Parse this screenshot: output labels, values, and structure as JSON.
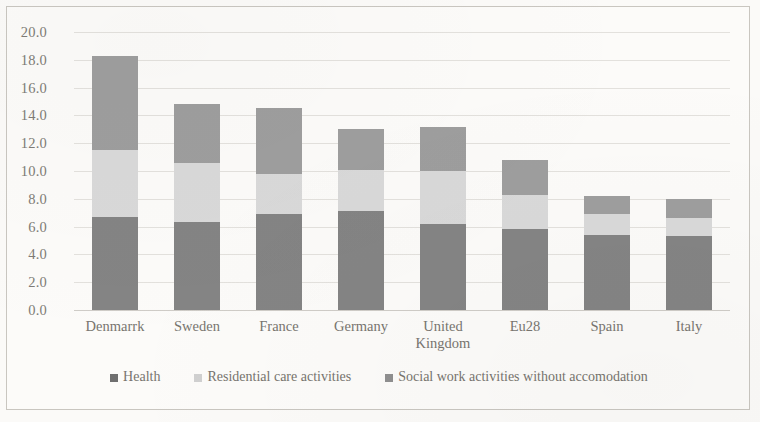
{
  "chart_data": {
    "type": "bar",
    "subtype": "stacked-bar",
    "title": "",
    "xlabel": "",
    "ylabel": "",
    "ylim": [
      0.0,
      20.0
    ],
    "ytick_step": 2.0,
    "ytick_labels": [
      "20.0",
      "18.0",
      "16.0",
      "14.0",
      "12.0",
      "10.0",
      "8.0",
      "6.0",
      "4.0",
      "2.0",
      "0.0"
    ],
    "ytick_values": [
      20.0,
      18.0,
      16.0,
      14.0,
      12.0,
      10.0,
      8.0,
      6.0,
      4.0,
      2.0,
      0.0
    ],
    "grid": true,
    "legend_position": "bottom",
    "categories": [
      "Denmarrk",
      "Sweden",
      "France",
      "Germany",
      "United Kingdom",
      "Eu28",
      "Spain",
      "Italy"
    ],
    "category_labels": [
      [
        "Denmarrk"
      ],
      [
        "Sweden"
      ],
      [
        "France"
      ],
      [
        "Germany"
      ],
      [
        "United",
        "Kingdom"
      ],
      [
        "Eu28"
      ],
      [
        "Spain"
      ],
      [
        "Italy"
      ]
    ],
    "series": [
      {
        "name": "Health",
        "color": "#848484",
        "values": [
          6.7,
          6.3,
          6.9,
          7.1,
          6.2,
          5.8,
          5.4,
          5.3
        ]
      },
      {
        "name": "Residential care activities",
        "color": "#d9d9d9",
        "values": [
          4.8,
          4.3,
          2.9,
          3.0,
          3.8,
          2.5,
          1.5,
          1.3
        ]
      },
      {
        "name": "Social work activities without accomodation",
        "color": "#9e9e9e",
        "values": [
          6.8,
          4.2,
          4.7,
          2.9,
          3.2,
          2.5,
          1.3,
          1.4
        ]
      }
    ],
    "totals": [
      18.3,
      14.8,
      14.5,
      13.0,
      13.2,
      10.8,
      8.2,
      8.0
    ]
  },
  "colors": {
    "background": "#fbfaf8",
    "frame_border": "#c9c6c0",
    "gridline": "#e3e1dd",
    "axis_text": "#7e7b76",
    "health": "#848484",
    "residential": "#d9d9d9",
    "social": "#9e9e9e"
  }
}
